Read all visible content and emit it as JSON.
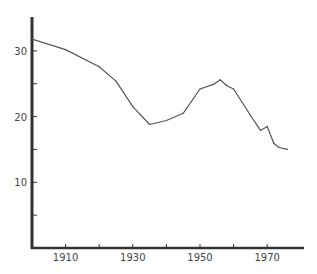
{
  "chart_data": {
    "type": "line",
    "title": "",
    "xlabel": "",
    "ylabel": "",
    "xlim": [
      1900,
      1980
    ],
    "ylim": [
      0,
      35
    ],
    "grid": false,
    "legend": "none",
    "x_ticks": [
      1910,
      1920,
      1930,
      1940,
      1950,
      1960,
      1970
    ],
    "x_tick_labels": [
      "1910",
      "",
      "1930",
      "",
      "1950",
      "",
      "1970"
    ],
    "y_ticks": [
      5,
      10,
      15,
      20,
      25,
      30
    ],
    "y_tick_labels": [
      "",
      "10",
      "",
      "20",
      "",
      "30"
    ],
    "series": [
      {
        "name": "series",
        "color": "#555555",
        "x": [
          1900,
          1910,
          1920,
          1925,
          1930,
          1935,
          1940,
          1945,
          1950,
          1954,
          1956,
          1958,
          1960,
          1965,
          1968,
          1970,
          1972,
          1973.5,
          1976
        ],
        "y": [
          31.8,
          30.2,
          27.6,
          25.4,
          21.5,
          18.8,
          19.4,
          20.5,
          24.2,
          24.9,
          25.6,
          24.7,
          24.2,
          20.2,
          17.9,
          18.5,
          15.9,
          15.3,
          15.0
        ]
      }
    ]
  }
}
